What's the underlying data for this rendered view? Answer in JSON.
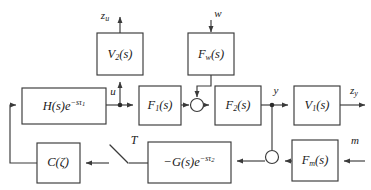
{
  "diagram": {
    "background": "#ffffff",
    "line_color": "#3a3a3a",
    "text_color": "#1a1a1a",
    "blocks": [
      {
        "id": "V2",
        "label": "V2(s)",
        "base": "V",
        "sub": "2",
        "tail": "(s)",
        "x": 97,
        "y": 33,
        "w": 46,
        "h": 42
      },
      {
        "id": "Fw",
        "label": "Fw(s)",
        "base": "F",
        "sub": "w",
        "tail": "(s)",
        "x": 188,
        "y": 33,
        "w": 46,
        "h": 42
      },
      {
        "id": "H",
        "label": "H(s)e^{-sτ1}",
        "base": "H",
        "sub": "",
        "tail": "(s)",
        "x": 22,
        "y": 88,
        "w": 84,
        "h": 36
      },
      {
        "id": "F1",
        "label": "F1(s)",
        "base": "F",
        "sub": "1",
        "tail": "(s)",
        "x": 139,
        "y": 86,
        "w": 42,
        "h": 39
      },
      {
        "id": "F2",
        "label": "F2(s)",
        "base": "F",
        "sub": "2",
        "tail": "(s)",
        "x": 215,
        "y": 86,
        "w": 46,
        "h": 39
      },
      {
        "id": "V1",
        "label": "V1(s)",
        "base": "V",
        "sub": "1",
        "tail": "(s)",
        "x": 294,
        "y": 86,
        "w": 46,
        "h": 39
      },
      {
        "id": "C",
        "label": "C(ζ)",
        "base": "C",
        "sub": "",
        "tail": "(ζ)",
        "x": 37,
        "y": 143,
        "w": 43,
        "h": 40
      },
      {
        "id": "G",
        "label": "-G(s)e^{-sτ2}",
        "base": "G",
        "sub": "",
        "tail": "(s)",
        "x": 148,
        "y": 142,
        "w": 83,
        "h": 41
      },
      {
        "id": "Fm",
        "label": "Fm(s)",
        "base": "F",
        "sub": "m",
        "tail": "(s)",
        "x": 292,
        "y": 140,
        "w": 46,
        "h": 41
      }
    ],
    "signals": [
      {
        "id": "zu",
        "base": "z",
        "sub": "u",
        "x": 85,
        "y": 16
      },
      {
        "id": "w",
        "base": "w",
        "sub": "",
        "x": 215,
        "y": 14
      },
      {
        "id": "u",
        "base": "u",
        "sub": "",
        "x": 113,
        "y": 92
      },
      {
        "id": "y",
        "base": "y",
        "sub": "",
        "x": 275,
        "y": 90
      },
      {
        "id": "zy",
        "base": "z",
        "sub": "y",
        "x": 354,
        "y": 90
      },
      {
        "id": "m",
        "base": "m",
        "sub": "",
        "x": 355,
        "y": 139
      },
      {
        "id": "T",
        "base": "T",
        "sub": "",
        "x": 130,
        "y": 140
      }
    ],
    "junctions": [
      {
        "id": "sum-plant-input",
        "type": "sum-circle",
        "cx": 197,
        "cy": 105,
        "r": 6.5
      },
      {
        "id": "sum-measurement",
        "type": "sum-circle",
        "cx": 272,
        "cy": 157,
        "r": 6.5
      },
      {
        "id": "node-u-branch",
        "type": "branch-dot",
        "cx": 120,
        "cy": 105,
        "r": 2.2
      },
      {
        "id": "node-y-branch",
        "type": "branch-dot",
        "cx": 272,
        "cy": 105,
        "r": 2.2
      }
    ],
    "switch": {
      "id": "switch-T",
      "label": "T",
      "x1": 110,
      "y1": 145,
      "x2": 128,
      "y2": 163
    }
  }
}
